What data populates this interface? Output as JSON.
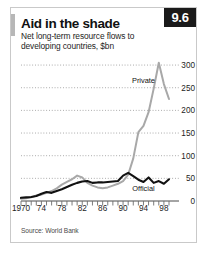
{
  "figure": {
    "badge": "9.6",
    "title": "Aid in the shade",
    "subtitle": "Net long-term resource flows to developing countries, $bn",
    "source": "Source: World Bank"
  },
  "chart_data": {
    "type": "line",
    "title": "Aid in the shade",
    "subtitle": "Net long-term resource flows to developing countries, $bn",
    "xlabel": "",
    "ylabel": "$bn",
    "xlim": [
      1970,
      1999
    ],
    "ylim": [
      0,
      320
    ],
    "yticks": [
      0,
      50,
      100,
      150,
      200,
      250,
      300
    ],
    "xticks": [
      1970,
      1974,
      1978,
      1982,
      1986,
      1990,
      1994,
      1998
    ],
    "xticklabels": [
      "1970",
      "74",
      "78",
      "82",
      "86",
      "90",
      "94",
      "98"
    ],
    "grid": true,
    "grid_style": "dotted-horizontal",
    "legend": "inline-annotations",
    "annotations": [
      {
        "text": "Private",
        "x": 1994,
        "y": 268
      },
      {
        "text": "Official",
        "x": 1994,
        "y": 28
      }
    ],
    "x": [
      1970,
      1971,
      1972,
      1973,
      1974,
      1975,
      1976,
      1977,
      1978,
      1979,
      1980,
      1981,
      1982,
      1983,
      1984,
      1985,
      1986,
      1987,
      1988,
      1989,
      1990,
      1991,
      1992,
      1993,
      1994,
      1995,
      1996,
      1997,
      1998,
      1999
    ],
    "series": [
      {
        "name": "Private",
        "color": "#a8a8a8",
        "values": [
          5,
          6,
          8,
          12,
          14,
          18,
          22,
          28,
          36,
          42,
          48,
          56,
          52,
          40,
          34,
          30,
          28,
          30,
          34,
          38,
          44,
          58,
          94,
          152,
          166,
          196,
          248,
          305,
          258,
          225
        ]
      },
      {
        "name": "Official",
        "color": "#111111",
        "values": [
          7,
          8,
          9,
          11,
          16,
          20,
          18,
          22,
          26,
          31,
          36,
          40,
          43,
          44,
          40,
          41,
          41,
          42,
          43,
          44,
          56,
          62,
          55,
          47,
          42,
          52,
          40,
          44,
          38,
          48
        ]
      }
    ]
  }
}
